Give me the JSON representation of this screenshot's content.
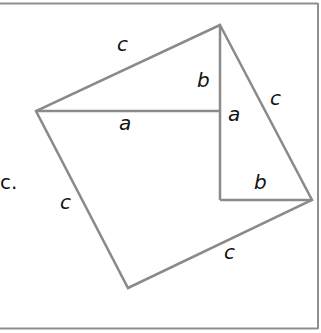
{
  "diagram": {
    "stroke_color": "#8a8a8a",
    "border_color": "#8f8f8f",
    "labels": {
      "top_left_c": "c",
      "horizontal_a": "a",
      "vertical_b": "b",
      "vertical_a": "a",
      "right_c": "c",
      "inner_b": "b",
      "left_c": "c",
      "bottom_c": "c"
    },
    "stray_text": "c."
  }
}
